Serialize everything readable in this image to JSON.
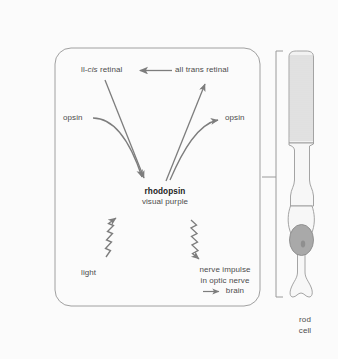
{
  "figure": {
    "background_color": "#fbfbfb",
    "line_color": "#8a8a8a",
    "text_color": "#4c4c4c",
    "panel_border_color": "#9a9a9a"
  },
  "diagram": {
    "nodes": {
      "cis_retinal_prefix": "ll-",
      "cis_retinal_italic": "cis",
      "cis_retinal_suffix": " retinal",
      "cis_retinal_full": "ll-cis retinal",
      "all_trans_retinal": "all trans retinal",
      "opsin_left": "opsin",
      "opsin_right": "opsin",
      "rhodopsin": "rhodopsin",
      "visual_purple": "visual purple",
      "light": "light",
      "nerve_impulse_line1": "nerve impulse",
      "nerve_impulse_line2": "in optic nerve",
      "nerve_impulse_line3": "brain"
    },
    "arrows": [
      {
        "name": "all-trans-to-11-cis",
        "style": "straight",
        "direction": "right-to-left",
        "from": "all trans retinal",
        "to": "ll-cis retinal"
      },
      {
        "name": "11-cis-to-rhodopsin",
        "style": "straight",
        "direction": "down-right",
        "from": "ll-cis retinal",
        "to": "rhodopsin"
      },
      {
        "name": "opsin-left-to-rhodopsin",
        "style": "curved",
        "direction": "down-right",
        "from": "opsin",
        "to": "rhodopsin"
      },
      {
        "name": "rhodopsin-to-all-trans",
        "style": "straight",
        "direction": "up-right",
        "from": "rhodopsin",
        "to": "all trans retinal"
      },
      {
        "name": "rhodopsin-to-opsin-right",
        "style": "curved",
        "direction": "up-right",
        "from": "rhodopsin",
        "to": "opsin"
      },
      {
        "name": "light-to-rhodopsin",
        "style": "wavy",
        "direction": "up-right",
        "from": "light",
        "to": "rhodopsin"
      },
      {
        "name": "rhodopsin-to-nerve-impulse",
        "style": "wavy",
        "direction": "down-right",
        "from": "rhodopsin",
        "to": "nerve impulse"
      },
      {
        "name": "to-brain",
        "style": "straight",
        "direction": "right",
        "to": "brain"
      }
    ]
  },
  "rod_cell": {
    "label_line1": "rod",
    "label_line2": "cell",
    "nucleus_color": "#a8a8a8",
    "outline_color": "#9a9a9a",
    "outer_segment_discs": 46,
    "bracket": "vertical-bracket-with-pointer"
  }
}
